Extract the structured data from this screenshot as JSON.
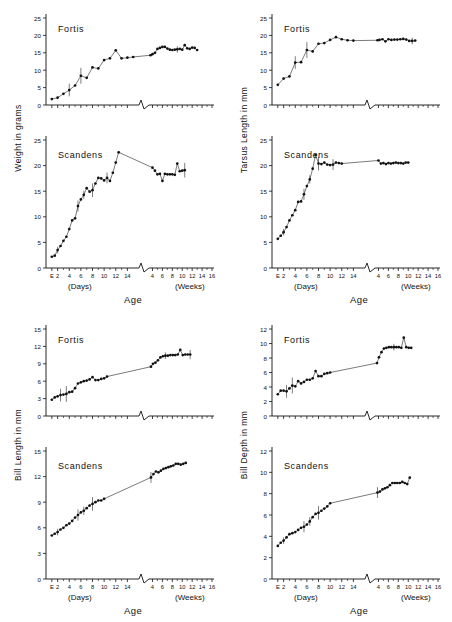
{
  "figure": {
    "background": "#ffffff",
    "ink": "#111111",
    "marker_color": "#111111",
    "line_color": "#222222"
  },
  "axis": {
    "x_title": "Age",
    "x_group_left": "(Days)",
    "x_group_right": "(Weeks)",
    "days_ticks": [
      "E",
      "2",
      "4",
      "6",
      "8",
      "10",
      "12",
      "14"
    ],
    "weeks_ticks": [
      "4",
      "6",
      "8",
      "10",
      "12",
      "14",
      "16"
    ],
    "break_symbol": "axis-break"
  },
  "panels": [
    {
      "id": "weight",
      "ylabel": "Weight in grams",
      "units": "grams",
      "top": {
        "species": "Fortis",
        "ylim": [
          0,
          25
        ],
        "yticks": [
          0,
          5,
          10,
          15,
          20,
          25
        ]
      },
      "bottom": {
        "species": "Scandens",
        "ylim": [
          0,
          25
        ],
        "yticks": [
          0,
          5,
          10,
          15,
          20,
          25
        ]
      }
    },
    {
      "id": "tarsus-length",
      "ylabel": "Tarsus Length in mm",
      "units": "mm",
      "top": {
        "species": "Fortis",
        "ylim": [
          0,
          25
        ],
        "yticks": [
          0,
          5,
          10,
          15,
          20,
          25
        ]
      },
      "bottom": {
        "species": "Scandens",
        "ylim": [
          0,
          25
        ],
        "yticks": [
          0,
          5,
          10,
          15,
          20,
          25
        ]
      }
    },
    {
      "id": "bill-length",
      "ylabel": "Bill Length in mm",
      "units": "mm",
      "top": {
        "species": "Fortis",
        "ylim": [
          0,
          15
        ],
        "yticks": [
          0,
          3,
          6,
          9,
          12,
          15
        ]
      },
      "bottom": {
        "species": "Scandens",
        "ylim": [
          0,
          15
        ],
        "yticks": [
          0,
          3,
          6,
          9,
          12,
          15
        ]
      }
    },
    {
      "id": "bill-depth",
      "ylabel": "Bill Depth in mm",
      "units": "mm",
      "top": {
        "species": "Fortis",
        "ylim": [
          0,
          12
        ],
        "yticks": [
          0,
          2,
          4,
          6,
          8,
          10,
          12
        ]
      },
      "bottom": {
        "species": "Scandens",
        "ylim": [
          0,
          12
        ],
        "yticks": [
          0,
          2,
          4,
          6,
          8,
          10,
          12
        ]
      }
    }
  ],
  "chart_data": [
    {
      "type": "line",
      "title": "Weight — Fortis",
      "xlabel": "Age",
      "ylabel": "Weight in grams",
      "ylim": [
        0,
        25
      ],
      "grid": false,
      "legend": "none",
      "x_days": [
        1,
        2,
        3,
        4,
        5,
        6,
        7,
        8,
        9,
        10,
        11,
        12,
        13,
        14,
        15
      ],
      "y_days": [
        1.7,
        2.1,
        3.2,
        4.3,
        5.6,
        8.4,
        7.8,
        10.8,
        10.5,
        12.9,
        13.4,
        15.7,
        13.4,
        13.6,
        13.8
      ],
      "x_weeks": [
        3.6,
        4.0,
        4.5,
        5.0,
        5.5,
        6.0,
        6.5,
        7.0,
        7.5,
        8.0,
        8.5,
        9.0,
        9.5,
        10.0,
        10.5,
        11.0,
        11.5,
        12.0,
        12.5,
        13.0,
        13.5,
        14.0,
        14.5,
        15.0
      ],
      "y_weeks": [
        14.3,
        14.6,
        15.0,
        16.1,
        16.4,
        16.7,
        16.7,
        16.2,
        15.9,
        15.8,
        15.9,
        16.0,
        16.1,
        15.9,
        17.2,
        16.3,
        16.1,
        16.5,
        16.4,
        15.8
      ],
      "errorbars": true
    },
    {
      "type": "line",
      "title": "Weight — Scandens",
      "xlabel": "Age",
      "ylabel": "Weight in grams",
      "ylim": [
        0,
        25
      ],
      "grid": false,
      "legend": "none",
      "x_days": [
        1,
        1.5,
        2,
        2.5,
        3,
        3.5,
        4,
        4.5,
        5,
        5.5,
        6,
        6.5,
        7,
        7.5,
        8,
        8.5,
        9,
        9.5,
        10,
        10.5,
        11,
        11.5,
        12,
        12.5,
        13,
        13.5,
        14
      ],
      "y_days": [
        2.2,
        2.4,
        3.5,
        4.3,
        5.3,
        6.1,
        7.6,
        9.3,
        9.7,
        12.1,
        13.4,
        14.3,
        15.6,
        14.9,
        15.2,
        16.5,
        17.6,
        17.5,
        17.1,
        17.6,
        17.0,
        18.6,
        20.6,
        22.6
      ],
      "x_weeks": [
        4.0,
        4.5,
        5.0,
        5.5,
        6.0,
        6.5,
        7.0,
        7.5,
        8.0,
        8.5,
        9.0,
        9.5,
        10.0,
        10.5,
        11.0,
        11.5,
        12.0,
        12.5,
        13.0,
        13.5,
        14.0,
        14.5,
        15.0
      ],
      "y_weeks": [
        19.6,
        19.0,
        18.3,
        18.4,
        17.0,
        18.4,
        18.3,
        18.3,
        18.3,
        18.2,
        20.4,
        18.9,
        19.0,
        19.1
      ],
      "errorbars": true
    },
    {
      "type": "line",
      "title": "Tarsus Length — Fortis",
      "xlabel": "Age",
      "ylabel": "Tarsus Length in mm",
      "ylim": [
        0,
        25
      ],
      "grid": false,
      "legend": "none",
      "x_days": [
        1,
        2,
        3,
        4,
        5,
        6,
        7,
        8,
        9,
        10,
        11,
        12,
        13,
        14
      ],
      "y_days": [
        5.8,
        7.6,
        8.2,
        12.2,
        12.3,
        15.8,
        15.4,
        17.6,
        17.8,
        18.7,
        19.5,
        18.9,
        18.6,
        18.5
      ],
      "x_weeks": [
        3.8,
        4.2,
        4.8,
        5.4,
        6.0,
        6.6,
        7.2,
        7.8,
        8.4,
        9.0,
        9.6,
        10.2,
        10.8,
        11.4,
        12.0,
        12.6,
        13.2,
        13.8,
        14.4,
        15.0
      ],
      "y_weeks": [
        18.6,
        18.7,
        18.9,
        18.3,
        18.9,
        18.7,
        18.8,
        18.8,
        18.9,
        19.0,
        18.8,
        18.4,
        18.4,
        18.5
      ],
      "errorbars": true
    },
    {
      "type": "line",
      "title": "Tarsus Length — Scandens",
      "xlabel": "Age",
      "ylabel": "Tarsus Length in mm",
      "ylim": [
        0,
        25
      ],
      "grid": false,
      "legend": "none",
      "x_days": [
        1,
        1.5,
        2,
        2.5,
        3,
        3.5,
        4,
        4.5,
        5,
        5.5,
        6,
        6.5,
        7,
        7.5,
        8,
        8.5,
        9,
        9.5,
        10,
        10.5,
        11,
        11.5,
        12,
        12.5,
        13,
        13.5,
        14
      ],
      "y_days": [
        5.7,
        6.3,
        7.0,
        8.0,
        9.3,
        10.3,
        11.3,
        12.9,
        13.0,
        14.4,
        16.0,
        17.3,
        19.4,
        22.1,
        20.4,
        20.3,
        20.6,
        20.2,
        20.1,
        20.2,
        20.6,
        20.5,
        20.4
      ],
      "x_weeks": [
        4.0,
        4.5,
        5.0,
        5.5,
        6.0,
        6.5,
        7.0,
        7.5,
        8.0,
        8.5,
        9.0,
        9.5,
        10.0,
        10.5,
        11.0,
        11.5,
        12.0,
        12.5,
        13.0,
        13.5,
        14.0,
        14.5,
        15.0
      ],
      "y_weeks": [
        21.0,
        20.4,
        20.5,
        20.3,
        20.5,
        20.4,
        20.5,
        20.6,
        20.5,
        20.5,
        20.4,
        20.6,
        20.6
      ],
      "errorbars": true
    },
    {
      "type": "line",
      "title": "Bill Length — Fortis",
      "xlabel": "Age",
      "ylabel": "Bill Length in mm",
      "ylim": [
        0,
        15
      ],
      "grid": false,
      "legend": "none",
      "x_days": [
        1,
        1.5,
        2,
        2.5,
        3,
        3.5,
        4,
        4.5,
        5,
        5.5,
        6,
        6.5,
        7,
        7.5,
        8,
        8.5,
        9,
        9.5,
        10,
        10.5,
        11,
        11.5,
        12,
        12.5,
        13,
        13.5,
        14
      ],
      "y_days": [
        2.8,
        3.2,
        3.4,
        3.6,
        3.7,
        3.8,
        4.1,
        4.2,
        4.8,
        5.6,
        5.8,
        6.0,
        6.1,
        6.3,
        6.7,
        6.2,
        6.2,
        6.4,
        6.5,
        6.8
      ],
      "x_weeks": [
        3.7,
        4.1,
        4.6,
        5.1,
        5.6,
        6.1,
        6.6,
        7.1,
        7.6,
        8.1,
        8.6,
        9.1,
        9.6,
        10.1,
        10.6,
        11.1,
        11.6,
        12.1,
        12.6,
        13.1,
        13.6,
        14.1,
        14.6
      ],
      "y_weeks": [
        8.5,
        9.0,
        9.2,
        9.6,
        10.1,
        10.3,
        10.4,
        10.4,
        10.5,
        10.5,
        10.5,
        10.6,
        11.4,
        10.5,
        10.6,
        10.6,
        10.6
      ],
      "errorbars": true
    },
    {
      "type": "line",
      "title": "Bill Length — Scandens",
      "xlabel": "Age",
      "ylabel": "Bill Length in mm",
      "ylim": [
        0,
        15
      ],
      "grid": false,
      "legend": "none",
      "x_days": [
        1,
        1.5,
        2,
        2.5,
        3,
        3.5,
        4,
        4.5,
        5,
        5.5,
        6,
        6.5,
        7,
        7.5,
        8,
        8.5,
        9,
        9.5,
        10,
        10.5,
        11,
        11.5,
        12,
        12.5,
        13,
        13.5,
        14
      ],
      "y_days": [
        5.1,
        5.3,
        5.5,
        5.8,
        6.0,
        6.3,
        6.5,
        6.8,
        7.2,
        7.5,
        7.8,
        8.0,
        8.3,
        8.6,
        8.8,
        9.0,
        9.2,
        9.2,
        9.4
      ],
      "x_weeks": [
        3.7,
        4.2,
        4.7,
        5.2,
        5.7,
        6.2,
        6.7,
        7.2,
        7.7,
        8.2,
        8.7,
        9.2,
        9.7,
        10.2,
        10.7,
        11.2,
        11.7,
        12.2,
        12.7,
        13.2,
        13.7,
        14.2,
        14.7
      ],
      "y_weeks": [
        11.9,
        12.3,
        12.6,
        12.5,
        12.7,
        12.9,
        13.0,
        13.1,
        13.2,
        13.3,
        13.5,
        13.5,
        13.4,
        13.5,
        13.6
      ],
      "errorbars": true
    },
    {
      "type": "line",
      "title": "Bill Depth — Fortis",
      "xlabel": "Age",
      "ylabel": "Bill Depth in mm",
      "ylim": [
        0,
        12
      ],
      "grid": false,
      "legend": "none",
      "x_days": [
        1,
        1.5,
        2,
        2.5,
        3,
        3.5,
        4,
        4.5,
        5,
        5.5,
        6,
        6.5,
        7,
        7.5,
        8,
        8.5,
        9,
        9.5,
        10,
        10.5,
        11,
        11.5,
        12,
        12.5,
        13,
        13.5,
        14
      ],
      "y_days": [
        3.0,
        3.5,
        3.5,
        3.4,
        3.8,
        4.2,
        4.1,
        4.8,
        4.5,
        4.7,
        5.0,
        5.0,
        5.2,
        6.2,
        5.5,
        5.5,
        5.8,
        5.9,
        6.0
      ],
      "x_weeks": [
        3.7,
        4.1,
        4.6,
        5.1,
        5.6,
        6.1,
        6.6,
        7.1,
        7.6,
        8.1,
        8.6,
        9.1,
        9.6,
        10.1,
        10.6,
        11.1,
        11.6,
        12.1,
        12.6,
        13.1,
        13.6,
        14.1,
        14.6
      ],
      "y_weeks": [
        7.3,
        8.1,
        8.8,
        9.3,
        9.4,
        9.5,
        9.5,
        9.5,
        9.5,
        9.5,
        9.4,
        10.8,
        9.5,
        9.4,
        9.4
      ],
      "errorbars": true
    },
    {
      "type": "line",
      "title": "Bill Depth — Scandens",
      "xlabel": "Age",
      "ylabel": "Bill Depth in mm",
      "ylim": [
        0,
        12
      ],
      "grid": false,
      "legend": "none",
      "x_days": [
        1,
        1.5,
        2,
        2.5,
        3,
        3.5,
        4,
        4.5,
        5,
        5.5,
        6,
        6.5,
        7,
        7.5,
        8,
        8.5,
        9,
        9.5,
        10,
        10.5,
        11,
        11.5,
        12,
        12.5,
        13,
        13.5,
        14
      ],
      "y_days": [
        3.1,
        3.4,
        3.6,
        3.9,
        4.2,
        4.3,
        4.4,
        4.6,
        4.8,
        4.9,
        5.1,
        5.4,
        5.8,
        6.1,
        6.2,
        6.4,
        6.6,
        6.8,
        7.1
      ],
      "x_weeks": [
        3.8,
        4.3,
        4.8,
        5.3,
        5.8,
        6.3,
        6.8,
        7.3,
        7.8,
        8.3,
        8.8,
        9.3,
        9.8,
        10.3,
        10.8,
        11.3,
        11.8,
        12.3,
        12.8,
        13.3,
        13.8,
        14.3,
        14.8
      ],
      "y_weeks": [
        8.1,
        8.2,
        8.4,
        8.5,
        8.6,
        8.8,
        9.0,
        9.0,
        9.0,
        9.0,
        9.1,
        9.0,
        8.9,
        9.5
      ],
      "errorbars": true
    }
  ]
}
